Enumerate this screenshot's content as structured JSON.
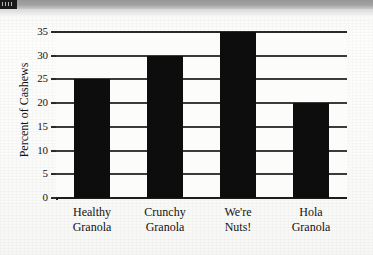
{
  "page": {
    "header_strip": {
      "badge_name": "page-corner-badge"
    }
  },
  "chart_data": {
    "type": "bar",
    "title": "",
    "subtitle": "",
    "xlabel": "",
    "ylabel": "Percent of Cashews",
    "categories": [
      "Healthy Granola",
      "Crunchy Granola",
      "We're Nuts!",
      "Hola Granola"
    ],
    "category_lines": [
      [
        "Healthy",
        "Granola"
      ],
      [
        "Crunchy",
        "Granola"
      ],
      [
        "We're",
        "Nuts!"
      ],
      [
        "Hola",
        "Granola"
      ]
    ],
    "values": [
      25,
      30,
      35,
      20
    ],
    "ylim": [
      0,
      35
    ],
    "yticks": [
      0,
      5,
      10,
      15,
      20,
      25,
      30,
      35
    ],
    "ytick_labels": [
      "0",
      "5",
      "10",
      "15",
      "20",
      "25",
      "30",
      "35"
    ],
    "grid": "horizontal",
    "legend": "none",
    "bar_color": "#0d0d0d",
    "grid_color": "#3b3b3b",
    "axis_color": "#1d1d1d",
    "plot_background": "#fcfcfb"
  }
}
